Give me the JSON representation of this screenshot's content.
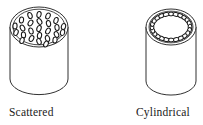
{
  "figure": {
    "title": "",
    "background_color": "#ffffff",
    "line_color": "#1a1a1a",
    "hole_fill_color": "#ffffff",
    "objects": [
      {
        "name": "scattered-cylinder",
        "caption": "Scattered",
        "pattern": "scattered",
        "center_x": 39,
        "top_y": 27,
        "radius_x": 29,
        "radius_y": 20,
        "body_height": 52,
        "rim_inset": 3,
        "hole_count": 26,
        "hole_rx": 2.1,
        "hole_ry": 3.1,
        "holes": [
          {
            "x": 39.0,
            "y": 14.5,
            "angle": 12
          },
          {
            "x": 30.0,
            "y": 15.5,
            "angle": -20
          },
          {
            "x": 48.0,
            "y": 16.0,
            "angle": 25
          },
          {
            "x": 21.5,
            "y": 20.0,
            "angle": 8
          },
          {
            "x": 39.5,
            "y": 21.5,
            "angle": -32
          },
          {
            "x": 56.0,
            "y": 20.5,
            "angle": 18
          },
          {
            "x": 30.5,
            "y": 23.0,
            "angle": 35
          },
          {
            "x": 48.5,
            "y": 23.5,
            "angle": -12
          },
          {
            "x": 15.0,
            "y": 26.0,
            "angle": 5
          },
          {
            "x": 22.5,
            "y": 28.0,
            "angle": -28
          },
          {
            "x": 39.0,
            "y": 28.5,
            "angle": 20
          },
          {
            "x": 57.0,
            "y": 27.5,
            "angle": -8
          },
          {
            "x": 63.5,
            "y": 26.5,
            "angle": 15
          },
          {
            "x": 31.0,
            "y": 31.0,
            "angle": -18
          },
          {
            "x": 48.0,
            "y": 31.0,
            "angle": 30
          },
          {
            "x": 16.0,
            "y": 32.5,
            "angle": 22
          },
          {
            "x": 23.5,
            "y": 35.0,
            "angle": -5
          },
          {
            "x": 39.5,
            "y": 35.5,
            "angle": 10
          },
          {
            "x": 56.5,
            "y": 34.5,
            "angle": -25
          },
          {
            "x": 62.5,
            "y": 32.5,
            "angle": 14
          },
          {
            "x": 31.5,
            "y": 38.5,
            "angle": 28
          },
          {
            "x": 47.5,
            "y": 38.5,
            "angle": -15
          },
          {
            "x": 22.0,
            "y": 40.5,
            "angle": 18
          },
          {
            "x": 39.0,
            "y": 41.5,
            "angle": -22
          },
          {
            "x": 55.0,
            "y": 40.0,
            "angle": 8
          },
          {
            "x": 46.0,
            "y": 44.0,
            "angle": 30
          }
        ]
      },
      {
        "name": "cylindrical-cylinder",
        "caption": "Cylindrical",
        "pattern": "ring",
        "center_x": 171,
        "top_y": 27,
        "radius_x": 25,
        "radius_y": 18,
        "body_height": 54,
        "rim_inset": 3,
        "hole_count": 24,
        "hole_rx": 1.9,
        "hole_ry": 2.9,
        "ring_radius_x": 19,
        "ring_radius_y": 13
      }
    ]
  }
}
